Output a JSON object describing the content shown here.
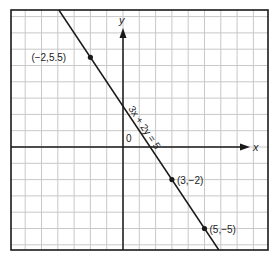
{
  "chart_data": {
    "type": "line",
    "title": "",
    "xlabel": "x",
    "ylabel": "y",
    "origin_label": "0",
    "xlim": [
      -6.9,
      8.9
    ],
    "ylim": [
      -6.3,
      8.4
    ],
    "grid": true,
    "series": [
      {
        "name": "3x + 2y = 5",
        "equation": "3x + 2y = 5",
        "slope": -1.5,
        "intercept": 2.5
      }
    ],
    "points": [
      {
        "x": -2,
        "y": 5.5,
        "label": "(−2,5.5)"
      },
      {
        "x": 3,
        "y": -2,
        "label": "(3,−2)"
      },
      {
        "x": 5,
        "y": -5,
        "label": "(5,−5)"
      }
    ]
  },
  "colors": {
    "grid": "#c8c8c8",
    "axis": "#1a1a1a",
    "line": "#1a1a1a",
    "frame": "#1a1a1a"
  }
}
